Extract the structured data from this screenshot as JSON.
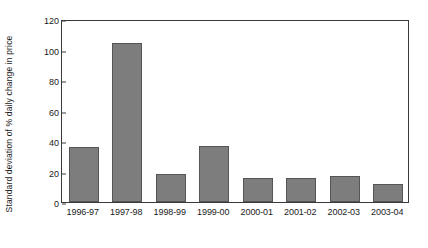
{
  "chart_data": {
    "type": "bar",
    "title": "",
    "xlabel": "",
    "ylabel": "Standard deviation of % daily change in price",
    "categories": [
      "1996-97",
      "1997-98",
      "1998-99",
      "1999-00",
      "2000-01",
      "2001-02",
      "2002-03",
      "2003-04"
    ],
    "values": [
      36,
      104.5,
      18.5,
      37,
      16,
      16,
      17,
      12
    ],
    "ylim": [
      0,
      120
    ],
    "ytick_labels": [
      "0",
      "20",
      "40",
      "60",
      "80",
      "100",
      "120"
    ],
    "ytick_values": [
      0,
      20,
      40,
      60,
      80,
      100,
      120
    ],
    "grid": false,
    "legend": null,
    "bar_color": "#7d7d7d",
    "bar_edge_color": "#555555",
    "axis_color": "#3a3a3a",
    "background_color": "#ffffff"
  }
}
